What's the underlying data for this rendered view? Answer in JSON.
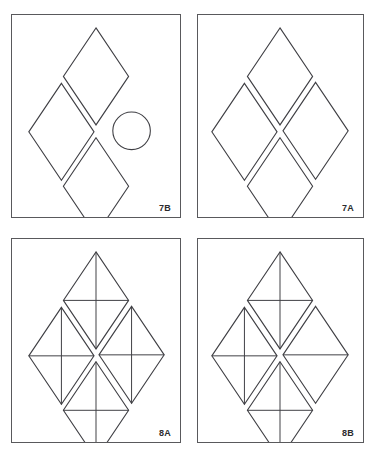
{
  "page": {
    "background_color": "#ffffff",
    "stroke_color": "#3f3f44",
    "border_color": "#59595c",
    "label_color": "#2b2b2e",
    "layout": "2x2 grid of bordered panels"
  },
  "panels": [
    {
      "id": "7b",
      "label": "7B",
      "position": "top-left",
      "shapes": [
        {
          "kind": "diamond",
          "slot": "top",
          "cx": 85,
          "cy": 62,
          "rx": 33,
          "ry": 49,
          "inner": "none"
        },
        {
          "kind": "diamond",
          "slot": "left",
          "cx": 50,
          "cy": 118,
          "rx": 33,
          "ry": 49,
          "inner": "none"
        },
        {
          "kind": "circle",
          "slot": "right",
          "cx": 121,
          "cy": 117,
          "r": 19
        },
        {
          "kind": "diamond",
          "slot": "bottom",
          "cx": 85,
          "cy": 173,
          "rx": 33,
          "ry": 49,
          "inner": "none"
        }
      ]
    },
    {
      "id": "7a",
      "label": "7A",
      "position": "top-right",
      "shapes": [
        {
          "kind": "diamond",
          "slot": "top",
          "cx": 83,
          "cy": 62,
          "rx": 33,
          "ry": 49,
          "inner": "none"
        },
        {
          "kind": "diamond",
          "slot": "left",
          "cx": 47,
          "cy": 118,
          "rx": 33,
          "ry": 49,
          "inner": "none"
        },
        {
          "kind": "diamond",
          "slot": "right",
          "cx": 119,
          "cy": 117,
          "rx": 33,
          "ry": 49,
          "inner": "none"
        },
        {
          "kind": "diamond",
          "slot": "bottom",
          "cx": 83,
          "cy": 173,
          "rx": 33,
          "ry": 49,
          "inner": "none"
        }
      ]
    },
    {
      "id": "8a",
      "label": "8A",
      "position": "bottom-left",
      "shapes": [
        {
          "kind": "diamond",
          "slot": "top",
          "cx": 85,
          "cy": 62,
          "rx": 33,
          "ry": 49,
          "inner": "cross"
        },
        {
          "kind": "diamond",
          "slot": "left",
          "cx": 50,
          "cy": 118,
          "rx": 33,
          "ry": 49,
          "inner": "cross"
        },
        {
          "kind": "diamond",
          "slot": "right",
          "cx": 121,
          "cy": 117,
          "rx": 33,
          "ry": 49,
          "inner": "cross"
        },
        {
          "kind": "diamond",
          "slot": "bottom",
          "cx": 85,
          "cy": 173,
          "rx": 33,
          "ry": 49,
          "inner": "cross"
        }
      ]
    },
    {
      "id": "8b",
      "label": "8B",
      "position": "bottom-right",
      "shapes": [
        {
          "kind": "diamond",
          "slot": "top",
          "cx": 83,
          "cy": 62,
          "rx": 33,
          "ry": 49,
          "inner": "cross"
        },
        {
          "kind": "diamond",
          "slot": "left",
          "cx": 47,
          "cy": 118,
          "rx": 33,
          "ry": 49,
          "inner": "cross"
        },
        {
          "kind": "diamond",
          "slot": "right",
          "cx": 119,
          "cy": 117,
          "rx": 33,
          "ry": 49,
          "inner": "horizontal"
        },
        {
          "kind": "diamond",
          "slot": "bottom",
          "cx": 83,
          "cy": 173,
          "rx": 33,
          "ry": 49,
          "inner": "cross"
        }
      ]
    }
  ]
}
